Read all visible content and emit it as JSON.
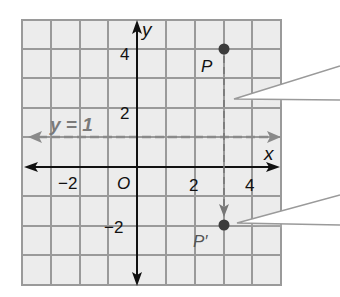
{
  "figure": {
    "axes": {
      "x_label": "x",
      "y_label": "y",
      "origin_label": "O",
      "x_ticks": [
        {
          "value": -2,
          "label": "−2"
        },
        {
          "value": 2,
          "label": "2"
        },
        {
          "value": 4,
          "label": "4"
        }
      ],
      "y_ticks": [
        {
          "value": 4,
          "label": "4"
        },
        {
          "value": 2,
          "label": "2"
        },
        {
          "value": -2,
          "label": "−2"
        }
      ],
      "x_range": [
        -4,
        5
      ],
      "y_range": [
        -4,
        5
      ],
      "grid": true
    },
    "line": {
      "label": "y = 1",
      "equation_y": 1,
      "style": "dashed",
      "color": "#8a8a8a"
    },
    "points": [
      {
        "name": "P",
        "label": "P",
        "x": 3,
        "y": 4
      },
      {
        "name": "P-prime",
        "label": "P′",
        "x": 3,
        "y": -2
      }
    ],
    "callouts": [
      {
        "name": "callout-upper",
        "text": ""
      },
      {
        "name": "callout-lower",
        "text": ""
      }
    ],
    "colors": {
      "grid_fill": "#ececec",
      "grid_line": "#9a9a9a",
      "axis": "#111111",
      "point": "#444444",
      "dashed": "#8a8a8a",
      "label_gray": "#7a7a7a"
    }
  }
}
